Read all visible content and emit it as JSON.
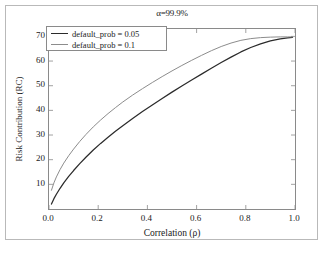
{
  "chart_data": {
    "type": "line",
    "title": "α=99.9%",
    "xlabel": "Correlation (ρ)",
    "ylabel": "Risk Contribution (RC)",
    "xlim": [
      0.0,
      1.0
    ],
    "ylim": [
      0.0,
      73.0
    ],
    "grid": false,
    "legend_position": "upper-left-inside",
    "xticks": [
      "0.0",
      "0.2",
      "0.4",
      "0.6",
      "0.8",
      "1.0"
    ],
    "xtick_values": [
      0.0,
      0.2,
      0.4,
      0.6,
      0.8,
      1.0
    ],
    "yticks": [
      "10",
      "20",
      "30",
      "40",
      "50",
      "60",
      "70"
    ],
    "ytick_values": [
      10,
      20,
      30,
      40,
      50,
      60,
      70
    ],
    "series": [
      {
        "name": "default_prob = 0.05",
        "color": "#2b2b2b",
        "x": [
          0.01,
          0.02,
          0.03,
          0.045,
          0.06,
          0.08,
          0.1,
          0.125,
          0.15,
          0.18,
          0.21,
          0.24,
          0.27,
          0.3,
          0.34,
          0.38,
          0.42,
          0.46,
          0.5,
          0.54,
          0.58,
          0.62,
          0.66,
          0.7,
          0.74,
          0.78,
          0.82,
          0.86,
          0.9,
          0.94,
          0.97,
          0.99
        ],
        "y": [
          2.0,
          4.2,
          6.0,
          8.4,
          10.6,
          13.2,
          15.6,
          18.4,
          21.0,
          23.9,
          26.6,
          29.1,
          31.5,
          33.8,
          36.7,
          39.5,
          42.2,
          44.8,
          47.4,
          49.9,
          52.3,
          54.7,
          57.1,
          59.4,
          61.6,
          63.7,
          65.5,
          67.0,
          68.2,
          69.0,
          69.4,
          69.6
        ]
      },
      {
        "name": "default_prob = 0.1",
        "color": "#8c8c8c",
        "x": [
          0.01,
          0.02,
          0.03,
          0.045,
          0.06,
          0.08,
          0.1,
          0.125,
          0.15,
          0.18,
          0.21,
          0.24,
          0.27,
          0.3,
          0.34,
          0.38,
          0.42,
          0.46,
          0.5,
          0.54,
          0.58,
          0.62,
          0.66,
          0.7,
          0.74,
          0.78,
          0.82,
          0.86,
          0.9,
          0.94,
          0.97,
          0.99
        ],
        "y": [
          7.6,
          10.6,
          13.0,
          16.0,
          18.6,
          21.6,
          24.3,
          27.4,
          30.2,
          33.3,
          36.1,
          38.7,
          41.1,
          43.4,
          46.2,
          48.8,
          51.3,
          53.7,
          56.0,
          58.2,
          60.3,
          62.3,
          64.2,
          65.9,
          67.3,
          68.4,
          69.1,
          69.5,
          69.7,
          69.8,
          69.8,
          69.8
        ]
      }
    ],
    "annotations": []
  },
  "legend": {
    "entries": [
      {
        "label": "default_prob = 0.05"
      },
      {
        "label": "default_prob = 0.1"
      }
    ]
  }
}
